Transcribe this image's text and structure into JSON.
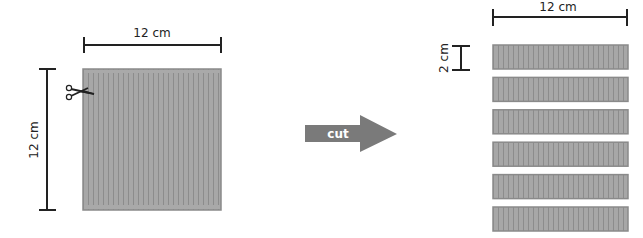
{
  "diagram": {
    "square": {
      "width_label": "12 cm",
      "height_label": "12 cm"
    },
    "arrow": {
      "label": "cut"
    },
    "strips": {
      "width_label": "12 cm",
      "height_label": "2 cm",
      "count": 6
    },
    "colors": {
      "fill": "#a3a3a3",
      "border": "#8a8a8a",
      "stripe": "#8f8f8f",
      "arrow": "#7a7a7a",
      "line": "#222222"
    }
  }
}
